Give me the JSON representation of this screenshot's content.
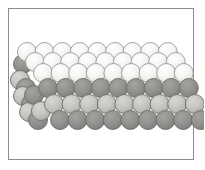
{
  "figure": {
    "background_color": "#ffffff",
    "frame": {
      "border_color": "#8c8c8c",
      "border_width": 1,
      "x": 8,
      "y": 8,
      "width": 186,
      "height": 152
    }
  },
  "palette": {
    "light": "#f2f2f0",
    "light_mid": "#e3e3e0",
    "pale": "#d9d9d5",
    "mid": "#b8b8b3",
    "dark": "#8d8d8a",
    "darker": "#7c7c79",
    "outline": "#6e6e6b",
    "outline_light": "#9a9a97"
  },
  "chart_data": {
    "type": "scatter",
    "xlabel": "",
    "ylabel": "",
    "grid": false,
    "legend": null,
    "sphere_radius": 9.5,
    "rows": [
      {
        "name": "row-1-top-back",
        "y": 52,
        "x_start": 27,
        "x_step": 17.6,
        "count": 9,
        "shade": "light",
        "outline": "outline_light",
        "offset_per_row": 0
      },
      {
        "name": "row-2-top",
        "y": 62,
        "x_start": 35,
        "x_step": 17.6,
        "count": 9,
        "shade": "light",
        "outline": "outline_light",
        "offset_per_row": 0
      },
      {
        "name": "row-3-top-front",
        "y": 73,
        "x_start": 43,
        "x_step": 17.6,
        "count": 9,
        "shade": "light",
        "outline": "outline_light",
        "offset_per_row": 0
      },
      {
        "name": "row-4-dark-layer",
        "y": 88,
        "x_start": 48,
        "x_step": 17.6,
        "count": 9,
        "shade": "dark",
        "outline": "outline",
        "offset_per_row": 0
      },
      {
        "name": "row-5-light-layer",
        "y": 104,
        "x_start": 54,
        "x_step": 17.6,
        "count": 9,
        "shade": "mid",
        "outline": "outline",
        "offset_per_row": 0
      },
      {
        "name": "row-6-bottom-dark",
        "y": 120,
        "x_start": 60,
        "x_step": 17.6,
        "count": 9,
        "shade": "dark",
        "outline": "outline",
        "offset_per_row": 0
      }
    ],
    "left_edge_column": [
      {
        "name": "edge-1",
        "x": 23,
        "y": 64,
        "shade": "dark"
      },
      {
        "name": "edge-2",
        "x": 20,
        "y": 80,
        "shade": "mid"
      },
      {
        "name": "edge-3",
        "x": 26,
        "y": 88,
        "shade": "dark"
      },
      {
        "name": "edge-4",
        "x": 23,
        "y": 96,
        "shade": "mid"
      },
      {
        "name": "edge-5",
        "x": 31,
        "y": 104,
        "shade": "dark"
      },
      {
        "name": "edge-6",
        "x": 29,
        "y": 112,
        "shade": "mid"
      },
      {
        "name": "edge-7",
        "x": 38,
        "y": 120,
        "shade": "dark"
      },
      {
        "name": "edge-8",
        "x": 34,
        "y": 95,
        "shade": "dark"
      },
      {
        "name": "edge-9",
        "x": 41,
        "y": 111,
        "shade": "mid"
      }
    ]
  }
}
